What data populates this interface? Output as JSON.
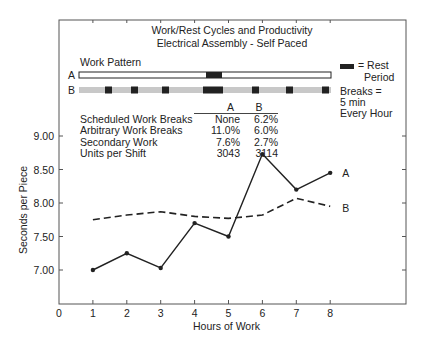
{
  "chart_data": {
    "type": "line",
    "title": "Work/Rest Cycles and Productivity",
    "subtitle": "Electrical Assembly - Self Paced",
    "xlabel": "Hours of Work",
    "ylabel": "Seconds per Piece",
    "x_ticks": [
      "0",
      "1",
      "2",
      "3",
      "4",
      "5",
      "6",
      "7",
      "8"
    ],
    "y_ticks": [
      "7.00",
      "7.50",
      "8.00",
      "8.50",
      "9.00"
    ],
    "xlim": [
      0,
      9.7
    ],
    "ylim": [
      6.55,
      9.25
    ],
    "grid": false,
    "x": [
      1,
      2,
      3,
      4,
      5,
      6,
      7,
      8
    ],
    "series": [
      {
        "name": "A",
        "style": "solid-with-markers",
        "values": [
          7.0,
          7.25,
          7.03,
          7.7,
          7.5,
          8.73,
          8.2,
          8.45
        ]
      },
      {
        "name": "B",
        "style": "dashed",
        "values": [
          7.75,
          7.82,
          7.87,
          7.8,
          7.77,
          7.82,
          8.07,
          7.95
        ]
      }
    ],
    "annotations": {
      "work_pattern_label": "Work Pattern",
      "pattern_a_label": "A",
      "pattern_b_label": "B",
      "legend_rest": "= Rest",
      "legend_period": "Period",
      "breaks_note": [
        "Breaks =",
        "5 min",
        "Every Hour"
      ],
      "pattern_a_rest_blocks": [
        [
          206,
          222
        ]
      ],
      "pattern_b_rest_blocks": [
        [
          105,
          112
        ],
        [
          131,
          138
        ],
        [
          162,
          169
        ],
        [
          203,
          223
        ],
        [
          252,
          259
        ],
        [
          286,
          293
        ],
        [
          322,
          329
        ]
      ]
    },
    "table": {
      "columns": [
        "",
        "A",
        "B"
      ],
      "rows": [
        [
          "Scheduled Work Breaks",
          "None",
          "6.2%"
        ],
        [
          "Arbitrary Work Breaks",
          "11.0%",
          "6.0%"
        ],
        [
          "Secondary Work",
          "7.6%",
          "2.7%"
        ],
        [
          "Units per Shift",
          "3043",
          "3114"
        ]
      ]
    },
    "colors": {
      "ink": "#222222",
      "pattern_b_fill": "#c8c8c8",
      "background": "#ffffff"
    }
  }
}
